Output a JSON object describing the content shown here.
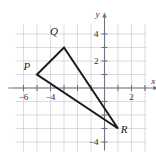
{
  "figure": {
    "axis_labels": {
      "x": "x",
      "y": "y"
    },
    "x_tick_labels": [
      "−6",
      "−4",
      "2"
    ],
    "y_tick_labels": [
      "4",
      "2",
      "−4"
    ],
    "vertex_labels": {
      "p": "P",
      "q": "Q",
      "r": "R"
    }
  },
  "chart_data": {
    "type": "scatter",
    "xlabel": "x",
    "ylabel": "y",
    "xlim": [
      -7,
      3.5
    ],
    "ylim": [
      -5,
      5
    ],
    "grid": true,
    "grid_spacing": 1,
    "legend": "none",
    "x_ticks": [
      -6,
      -4,
      2
    ],
    "x_tick_labels": [
      "−6",
      "−4",
      "2"
    ],
    "y_ticks": [
      4,
      2,
      -4
    ],
    "y_tick_labels": [
      "4",
      "2",
      "−4"
    ],
    "annotations": [
      {
        "label": "P",
        "x": -5,
        "y": 1,
        "label_offset_x": -0.75,
        "label_offset_y": 0.35
      },
      {
        "label": "Q",
        "x": -3,
        "y": 3,
        "label_offset_x": -0.75,
        "label_offset_y": 0.95
      },
      {
        "label": "R",
        "x": 1,
        "y": -3,
        "label_offset_x": 0.45,
        "label_offset_y": -0.35
      }
    ],
    "series": [
      {
        "name": "Triangle PQR",
        "closed": true,
        "points": [
          {
            "label": "P",
            "x": -5,
            "y": 1
          },
          {
            "label": "Q",
            "x": -3,
            "y": 3
          },
          {
            "label": "R",
            "x": 1,
            "y": -3
          }
        ]
      }
    ]
  }
}
